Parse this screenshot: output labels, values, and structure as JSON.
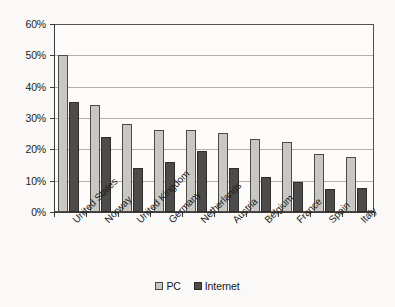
{
  "chart_data": {
    "type": "bar",
    "title": "",
    "subtitle": "",
    "xlabel": "",
    "ylabel": "",
    "ylim": [
      0,
      60
    ],
    "ytick_labels": [
      "0%",
      "10%",
      "20%",
      "30%",
      "40%",
      "50%",
      "60%"
    ],
    "ytick_values": [
      0,
      10,
      20,
      30,
      40,
      50,
      60
    ],
    "grid": true,
    "legend_position": "bottom-center",
    "categories": [
      "United States",
      "Norway",
      "United Kingdom",
      "Germany",
      "Netherlands",
      "Austria",
      "Belgium",
      "France",
      "Spain",
      "Italy"
    ],
    "series": [
      {
        "name": "PC",
        "color": "#c8c7c3",
        "values": [
          50.0,
          34.0,
          28.2,
          26.2,
          26.3,
          25.2,
          23.2,
          22.4,
          18.5,
          17.6
        ]
      },
      {
        "name": "Internet",
        "color": "#4d4c4a",
        "values": [
          35.0,
          24.1,
          14.1,
          16.1,
          19.4,
          14.2,
          11.3,
          9.5,
          7.5,
          7.6
        ]
      }
    ]
  },
  "legend": {
    "items": [
      {
        "label": "PC",
        "swatch": "pc"
      },
      {
        "label": "Internet",
        "swatch": "internet"
      }
    ]
  }
}
